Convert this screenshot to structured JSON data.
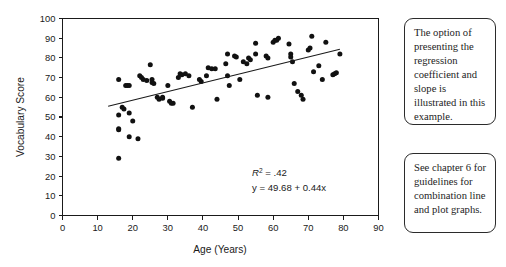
{
  "figure": {
    "background_color": "#ffffff",
    "ink_color": "#1a1a1a"
  },
  "chart_data": {
    "type": "scatter",
    "title": "",
    "xlabel": "Age (Years)",
    "ylabel": "Vocabulary Score",
    "xlim": [
      0,
      90
    ],
    "ylim": [
      0,
      100
    ],
    "xticks": [
      0,
      10,
      20,
      30,
      40,
      50,
      60,
      70,
      80,
      90
    ],
    "yticks": [
      0,
      10,
      20,
      30,
      40,
      50,
      60,
      70,
      80,
      90,
      100
    ],
    "grid": false,
    "legend": null,
    "marker_color": "#111111",
    "annotations": [
      {
        "name": "r-squared",
        "text": "R² = .42",
        "value": 0.42
      },
      {
        "name": "regression-equation",
        "text": "y = 49.68 + 0.44x",
        "intercept": 49.68,
        "slope": 0.44
      }
    ],
    "trendline": {
      "type": "linear",
      "intercept": 49.68,
      "slope": 0.44,
      "x_start": 13,
      "x_end": 79,
      "y_start": 55.4,
      "y_end": 84.4
    },
    "points": [
      [
        16,
        69
      ],
      [
        16,
        51
      ],
      [
        16,
        44
      ],
      [
        16,
        43.5
      ],
      [
        16,
        29
      ],
      [
        17,
        55
      ],
      [
        17.5,
        54
      ],
      [
        18,
        66
      ],
      [
        18.5,
        66
      ],
      [
        19,
        66
      ],
      [
        19,
        52
      ],
      [
        19,
        40
      ],
      [
        20,
        48
      ],
      [
        21.5,
        39
      ],
      [
        22,
        71
      ],
      [
        22.5,
        70
      ],
      [
        23,
        69
      ],
      [
        24,
        68.5
      ],
      [
        25,
        76.5
      ],
      [
        25.5,
        69
      ],
      [
        25.5,
        67.5
      ],
      [
        26,
        67
      ],
      [
        27,
        60
      ],
      [
        27.5,
        59
      ],
      [
        28.5,
        60
      ],
      [
        28.5,
        59.5
      ],
      [
        30,
        66
      ],
      [
        30.5,
        58
      ],
      [
        31,
        57
      ],
      [
        31.5,
        57
      ],
      [
        33,
        70
      ],
      [
        33.5,
        72
      ],
      [
        34,
        71.5
      ],
      [
        35,
        72
      ],
      [
        36,
        71
      ],
      [
        37,
        55
      ],
      [
        39,
        69
      ],
      [
        39.5,
        68
      ],
      [
        41,
        71
      ],
      [
        41.5,
        75
      ],
      [
        42.5,
        74.5
      ],
      [
        43.5,
        74.5
      ],
      [
        44,
        59
      ],
      [
        46.5,
        77
      ],
      [
        47,
        82
      ],
      [
        47,
        71
      ],
      [
        47.5,
        66
      ],
      [
        49,
        81
      ],
      [
        49.5,
        80.5
      ],
      [
        50.5,
        69
      ],
      [
        51.5,
        78
      ],
      [
        52.5,
        77
      ],
      [
        53,
        80
      ],
      [
        53.5,
        79
      ],
      [
        55,
        87.5
      ],
      [
        55,
        82
      ],
      [
        55.5,
        61
      ],
      [
        58,
        81
      ],
      [
        58.5,
        80
      ],
      [
        58.5,
        60
      ],
      [
        60,
        88
      ],
      [
        60.5,
        89
      ],
      [
        61,
        89
      ],
      [
        61.5,
        90
      ],
      [
        64.5,
        87
      ],
      [
        65,
        82
      ],
      [
        65,
        80.5
      ],
      [
        65.5,
        78
      ],
      [
        66,
        67
      ],
      [
        67,
        63
      ],
      [
        68,
        61
      ],
      [
        68.5,
        59
      ],
      [
        70,
        84
      ],
      [
        70.5,
        85
      ],
      [
        71,
        91
      ],
      [
        71.5,
        73
      ],
      [
        73,
        76
      ],
      [
        74,
        69
      ],
      [
        75,
        88
      ],
      [
        77,
        71.5
      ],
      [
        77.5,
        72
      ],
      [
        78,
        72.5
      ],
      [
        79,
        82
      ]
    ]
  },
  "callouts": [
    {
      "name": "callout-regression",
      "text": "The option of presenting the regression coefficient and slope is illustrated in this example."
    },
    {
      "name": "callout-chapter",
      "text": "See chapter 6 for guidelines for combination line and plot graphs."
    }
  ]
}
